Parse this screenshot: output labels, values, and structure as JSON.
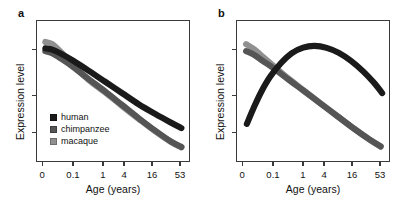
{
  "figure": {
    "panels": [
      {
        "label": "a",
        "xlabel": "Age (years)",
        "ylabel": "Expression level",
        "xticks": [
          "0",
          "0.1",
          "1",
          "4",
          "16",
          "53"
        ]
      },
      {
        "label": "b",
        "xlabel": "Age (years)",
        "ylabel": "Expression level",
        "xticks": [
          "0",
          "0.1",
          "1",
          "4",
          "16",
          "53"
        ]
      }
    ],
    "legend": {
      "items": [
        {
          "label": "human",
          "color": "#1a1a1a"
        },
        {
          "label": "chimpanzee",
          "color": "#555555"
        },
        {
          "label": "macaque",
          "color": "#909090"
        }
      ]
    }
  },
  "chart_data": [
    {
      "type": "line",
      "title": "a",
      "xlabel": "Age (years)",
      "ylabel": "Expression level",
      "x_tick_labels": [
        "0",
        "0.1",
        "1",
        "4",
        "16",
        "53"
      ],
      "x_tick_positions": [
        0.04,
        0.24,
        0.435,
        0.572,
        0.753,
        0.935
      ],
      "y_tick_positions": [
        0.21,
        0.53,
        0.79
      ],
      "grid": false,
      "legend_position": "lower-left",
      "series": [
        {
          "name": "human",
          "color": "#1a1a1a",
          "points": [
            [
              0.055,
              0.195
            ],
            [
              0.1,
              0.205
            ],
            [
              0.16,
              0.235
            ],
            [
              0.24,
              0.285
            ],
            [
              0.34,
              0.355
            ],
            [
              0.45,
              0.435
            ],
            [
              0.56,
              0.515
            ],
            [
              0.67,
              0.595
            ],
            [
              0.78,
              0.665
            ],
            [
              0.88,
              0.725
            ],
            [
              0.95,
              0.765
            ]
          ]
        },
        {
          "name": "chimpanzee",
          "color": "#555555",
          "points": [
            [
              0.055,
              0.215
            ],
            [
              0.1,
              0.23
            ],
            [
              0.16,
              0.27
            ],
            [
              0.24,
              0.33
            ],
            [
              0.34,
              0.415
            ],
            [
              0.45,
              0.505
            ],
            [
              0.56,
              0.6
            ],
            [
              0.67,
              0.695
            ],
            [
              0.78,
              0.785
            ],
            [
              0.88,
              0.86
            ],
            [
              0.95,
              0.9
            ]
          ]
        },
        {
          "name": "macaque",
          "color": "#909090",
          "points": [
            [
              0.055,
              0.15
            ],
            [
              0.1,
              0.165
            ],
            [
              0.16,
              0.225
            ],
            [
              0.24,
              0.32
            ],
            [
              0.34,
              0.42
            ],
            [
              0.45,
              0.512
            ],
            [
              0.56,
              0.607
            ],
            [
              0.67,
              0.7
            ],
            [
              0.78,
              0.79
            ],
            [
              0.88,
              0.863
            ],
            [
              0.95,
              0.903
            ]
          ]
        }
      ]
    },
    {
      "type": "line",
      "title": "b",
      "xlabel": "Age (years)",
      "ylabel": "Expression level",
      "x_tick_labels": [
        "0",
        "0.1",
        "1",
        "4",
        "16",
        "53"
      ],
      "x_tick_positions": [
        0.04,
        0.24,
        0.435,
        0.572,
        0.753,
        0.935
      ],
      "y_tick_positions": [
        0.21,
        0.53,
        0.79
      ],
      "grid": false,
      "legend_position": "none",
      "series": [
        {
          "name": "human",
          "color": "#1a1a1a",
          "points": [
            [
              0.065,
              0.735
            ],
            [
              0.11,
              0.62
            ],
            [
              0.16,
              0.505
            ],
            [
              0.22,
              0.395
            ],
            [
              0.29,
              0.3
            ],
            [
              0.36,
              0.23
            ],
            [
              0.435,
              0.19
            ],
            [
              0.51,
              0.178
            ],
            [
              0.59,
              0.192
            ],
            [
              0.67,
              0.228
            ],
            [
              0.75,
              0.285
            ],
            [
              0.83,
              0.36
            ],
            [
              0.9,
              0.44
            ],
            [
              0.955,
              0.515
            ]
          ]
        },
        {
          "name": "chimpanzee",
          "color": "#555555",
          "points": [
            [
              0.06,
              0.215
            ],
            [
              0.11,
              0.24
            ],
            [
              0.17,
              0.285
            ],
            [
              0.25,
              0.345
            ],
            [
              0.34,
              0.42
            ],
            [
              0.44,
              0.5
            ],
            [
              0.55,
              0.59
            ],
            [
              0.66,
              0.68
            ],
            [
              0.77,
              0.77
            ],
            [
              0.87,
              0.845
            ],
            [
              0.945,
              0.895
            ]
          ]
        },
        {
          "name": "macaque",
          "color": "#909090",
          "points": [
            [
              0.06,
              0.165
            ],
            [
              0.11,
              0.2
            ],
            [
              0.17,
              0.255
            ],
            [
              0.25,
              0.33
            ],
            [
              0.34,
              0.412
            ],
            [
              0.44,
              0.496
            ],
            [
              0.55,
              0.588
            ],
            [
              0.66,
              0.678
            ],
            [
              0.77,
              0.768
            ],
            [
              0.87,
              0.846
            ],
            [
              0.945,
              0.898
            ]
          ]
        }
      ]
    }
  ]
}
